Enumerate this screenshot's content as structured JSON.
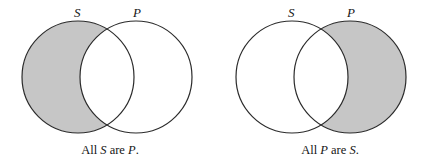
{
  "figure": {
    "background_color": "#ffffff",
    "outline_color": "#2b2b2b",
    "shade_color": "#c6c6c6",
    "diagrams": [
      {
        "id": "all-s-are-p",
        "left_circle_label": "S",
        "right_circle_label": "P",
        "shaded_region": "S-only",
        "caption": {
          "prefix": "All ",
          "subject": "S",
          "middle": " are ",
          "predicate": "P",
          "suffix": "."
        }
      },
      {
        "id": "all-p-are-s",
        "left_circle_label": "S",
        "right_circle_label": "P",
        "shaded_region": "P-only",
        "caption": {
          "prefix": "All ",
          "subject": "P",
          "middle": " are ",
          "predicate": "S",
          "suffix": "."
        }
      }
    ]
  }
}
